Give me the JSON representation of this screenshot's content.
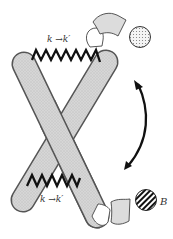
{
  "diagram": {
    "type": "mechanical-molecular-schematic",
    "labels": {
      "top_spring": "k →k′",
      "bottom_spring": "k →k′",
      "ligand_b": "B"
    },
    "elements": [
      {
        "name": "rod-left",
        "fill": "#d0d0d0",
        "pattern": "stipple"
      },
      {
        "name": "rod-right",
        "fill": "#d0d0d0",
        "pattern": "stipple"
      },
      {
        "name": "top-spring",
        "color": "#111111"
      },
      {
        "name": "bottom-spring",
        "color": "#111111"
      },
      {
        "name": "dotted-ball",
        "pattern": "dots"
      },
      {
        "name": "striped-ball-B",
        "pattern": "stripes"
      },
      {
        "name": "curved-double-arrow",
        "color": "#111111"
      }
    ],
    "colors": {
      "rod_fill": "#d0d0d0",
      "outline": "#333333",
      "spring": "#111111",
      "arrow": "#111111"
    }
  }
}
